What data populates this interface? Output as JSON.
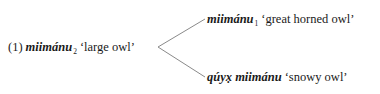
{
  "example": {
    "number": "(1)",
    "root": {
      "word": "miimánu",
      "subscript": "2",
      "gloss": "‘large owl’"
    },
    "branches": [
      {
        "word": "miimánu",
        "subscript": "1",
        "gloss": "‘great horned owl’"
      },
      {
        "word": "qúyx̣ miimánu",
        "subscript": "",
        "gloss": "‘snowy owl’"
      }
    ]
  }
}
